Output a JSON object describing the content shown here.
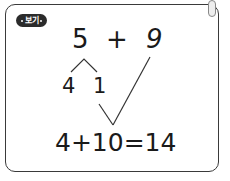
{
  "badge": {
    "label": "보기"
  },
  "problem": {
    "left_operand": "5",
    "operator": "+",
    "right_operand": "9"
  },
  "decomposition": {
    "part_a": "4",
    "part_b": "1"
  },
  "result": {
    "equation": "4+10=14"
  },
  "colors": {
    "border": "#3a3a3a",
    "badge_bg": "#2b2b2b",
    "text": "#1a1a1a"
  }
}
